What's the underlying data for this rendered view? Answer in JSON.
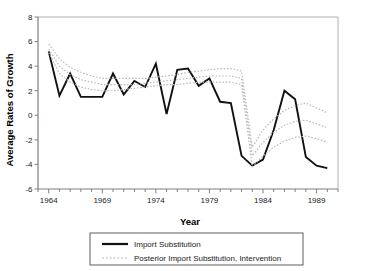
{
  "chart_data": {
    "type": "line",
    "title": "",
    "xlabel": "Year",
    "ylabel": "Average Rates of Growth",
    "xlim": [
      1963,
      1991
    ],
    "ylim": [
      -6,
      8
    ],
    "ytick_labels": [
      "8",
      "6",
      "4",
      "2",
      "0",
      "-2",
      "-4",
      "-6"
    ],
    "ytick_values": [
      8,
      6,
      4,
      2,
      0,
      -2,
      -4,
      -6
    ],
    "xtick_labels": [
      "1964",
      "1969",
      "1974",
      "1979",
      "1984",
      "1989"
    ],
    "xtick_values": [
      1964,
      1969,
      1974,
      1979,
      1984,
      1989
    ],
    "x_minor_step": 1,
    "grid": false,
    "legend_position": "below-plot",
    "series": [
      {
        "name": "Import Substitution",
        "style": "solid",
        "color": "#111111",
        "x": [
          1964,
          1965,
          1966,
          1967,
          1968,
          1969,
          1970,
          1971,
          1972,
          1973,
          1974,
          1975,
          1976,
          1977,
          1978,
          1979,
          1980,
          1981,
          1982,
          1983,
          1984,
          1985,
          1986,
          1987,
          1988,
          1989,
          1990
        ],
        "values": [
          5.2,
          1.6,
          3.4,
          1.5,
          1.5,
          1.5,
          3.4,
          1.7,
          2.8,
          2.3,
          4.2,
          0.1,
          3.7,
          3.8,
          2.4,
          3.0,
          1.1,
          1.0,
          -3.3,
          -4.1,
          -3.6,
          -1.2,
          2.0,
          1.3,
          -3.4,
          -4.1,
          -4.3
        ]
      },
      {
        "name": "Posterior Import Substitution, Intervention (upper band)",
        "style": "dotted",
        "color": "#b9b9b9",
        "x": [
          1964,
          1965,
          1966,
          1967,
          1968,
          1969,
          1970,
          1971,
          1972,
          1973,
          1974,
          1975,
          1976,
          1977,
          1978,
          1979,
          1980,
          1981,
          1982,
          1983,
          1984,
          1985,
          1986,
          1987,
          1988,
          1989,
          1990
        ],
        "values": [
          5.8,
          4.6,
          3.9,
          3.5,
          3.2,
          3.0,
          3.0,
          3.0,
          3.0,
          3.0,
          3.1,
          3.2,
          3.3,
          3.5,
          3.6,
          3.7,
          3.8,
          3.8,
          3.6,
          -2.6,
          -1.2,
          -0.3,
          0.4,
          0.8,
          1.0,
          0.6,
          0.2
        ]
      },
      {
        "name": "Posterior Import Substitution, Intervention (median)",
        "style": "dotted",
        "color": "#b9b9b9",
        "x": [
          1964,
          1965,
          1966,
          1967,
          1968,
          1969,
          1970,
          1971,
          1972,
          1973,
          1974,
          1975,
          1976,
          1977,
          1978,
          1979,
          1980,
          1981,
          1982,
          1983,
          1984,
          1985,
          1986,
          1987,
          1988,
          1989,
          1990
        ],
        "values": [
          5.4,
          4.0,
          3.3,
          2.9,
          2.7,
          2.5,
          2.5,
          2.5,
          2.5,
          2.6,
          2.7,
          2.8,
          2.9,
          3.0,
          3.1,
          3.2,
          3.2,
          3.2,
          3.0,
          -3.3,
          -2.2,
          -1.4,
          -0.8,
          -0.5,
          -0.4,
          -0.7,
          -1.0
        ]
      },
      {
        "name": "Posterior Import Substitution, Intervention (lower band)",
        "style": "dotted",
        "color": "#b9b9b9",
        "x": [
          1964,
          1965,
          1966,
          1967,
          1968,
          1969,
          1970,
          1971,
          1972,
          1973,
          1974,
          1975,
          1976,
          1977,
          1978,
          1979,
          1980,
          1981,
          1982,
          1983,
          1984,
          1985,
          1986,
          1987,
          1988,
          1989,
          1990
        ],
        "values": [
          5.1,
          3.4,
          2.7,
          2.3,
          2.1,
          2.0,
          2.0,
          2.1,
          2.2,
          2.3,
          2.4,
          2.5,
          2.5,
          2.6,
          2.7,
          2.7,
          2.7,
          2.7,
          2.5,
          -4.2,
          -3.3,
          -2.6,
          -2.1,
          -1.8,
          -1.7,
          -1.9,
          -2.2
        ]
      }
    ]
  },
  "legend": {
    "entries": [
      {
        "label": "Import Substitution",
        "style": "solid"
      },
      {
        "label": "Posterior Import Substitution, Intervention",
        "style": "dotted"
      }
    ]
  }
}
